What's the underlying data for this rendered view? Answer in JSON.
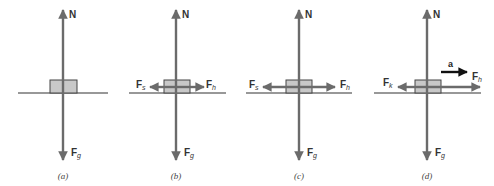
{
  "colors": {
    "force_arrow": "#6b6b6b",
    "acceleration_arrow": "#111111",
    "ground": "#333333",
    "block_fill": "#c8c8c8",
    "block_stroke": "#444444"
  },
  "panels": [
    {
      "id": "a",
      "caption": "(a)",
      "forces": {
        "normal": {
          "label": "N"
        },
        "gravity": {
          "label": "F",
          "sub": "g"
        }
      }
    },
    {
      "id": "b",
      "caption": "(b)",
      "forces": {
        "normal": {
          "label": "N"
        },
        "gravity": {
          "label": "F",
          "sub": "g"
        },
        "friction": {
          "label": "F",
          "sub": "s"
        },
        "horizontal": {
          "label": "F",
          "sub": "h"
        }
      }
    },
    {
      "id": "c",
      "caption": "(c)",
      "forces": {
        "normal": {
          "label": "N"
        },
        "gravity": {
          "label": "F",
          "sub": "g"
        },
        "friction": {
          "label": "F",
          "sub": "s"
        },
        "horizontal": {
          "label": "F",
          "sub": "h"
        }
      }
    },
    {
      "id": "d",
      "caption": "(d)",
      "forces": {
        "normal": {
          "label": "N"
        },
        "gravity": {
          "label": "F",
          "sub": "g"
        },
        "friction": {
          "label": "F",
          "sub": "k"
        },
        "horizontal": {
          "label": "F",
          "sub": "h"
        }
      },
      "acceleration": {
        "label": "a"
      }
    }
  ]
}
